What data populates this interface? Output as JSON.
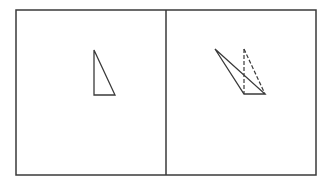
{
  "figure": {
    "stroke_color": "#3a3a3a",
    "background": "#ffffff",
    "frame": {
      "x1": 16,
      "y1": 10,
      "x2": 316,
      "y2": 175,
      "divider_x": 166
    },
    "left_panel": {
      "triangle": {
        "points": "94,50 94,95 115,95"
      }
    },
    "right_panel": {
      "solid_triangle": {
        "points": "215,49 244,94 265,94"
      },
      "dashed_edges": [
        {
          "x1": 244,
          "y1": 49,
          "x2": 244,
          "y2": 94
        },
        {
          "x1": 244,
          "y1": 49,
          "x2": 265,
          "y2": 94
        }
      ]
    }
  }
}
